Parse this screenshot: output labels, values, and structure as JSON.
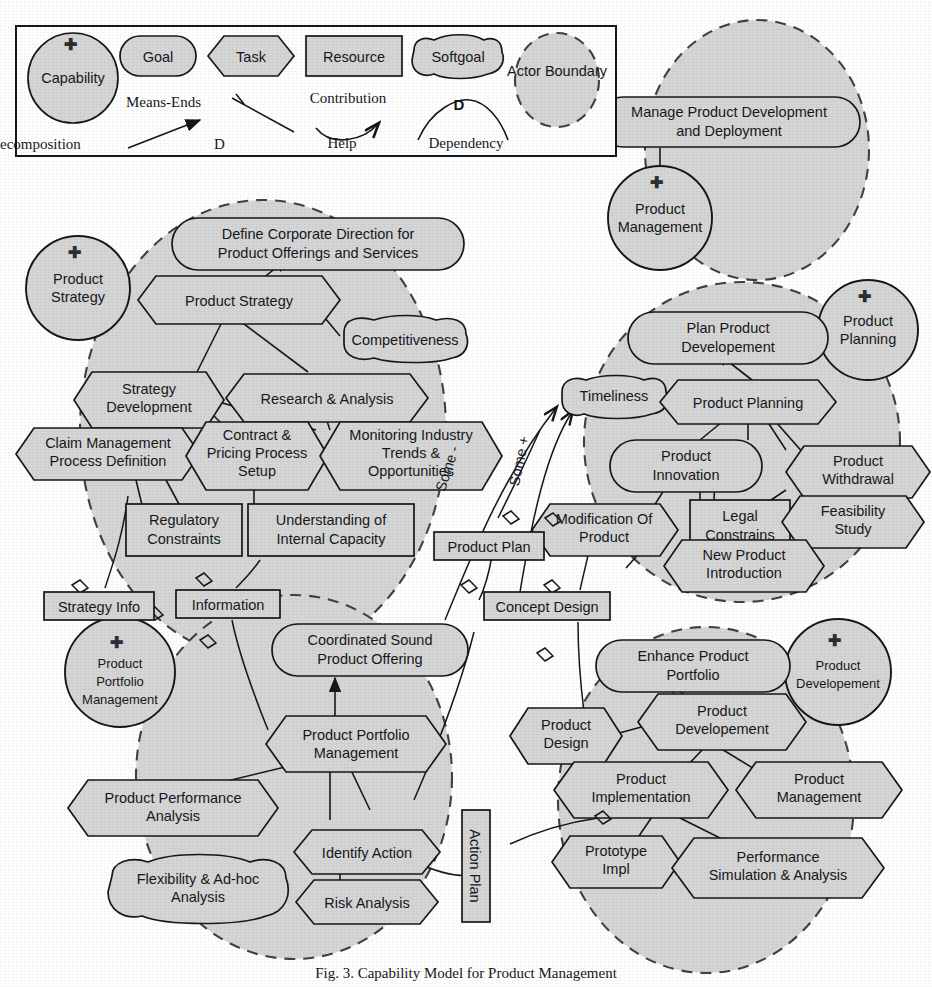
{
  "figure": {
    "title": "Capability Model for Product Management",
    "caption": "Fig. 3. Capability Model for Product Management",
    "colors": {
      "node_fill": "#d6d6d6",
      "node_stroke": "#14181b",
      "boundary_stroke": "#3c4246",
      "page_bg": "#ffffff"
    }
  },
  "legend": {
    "title": "Legend",
    "shapes": [
      {
        "name": "capability",
        "label": "Capability",
        "shape": "circle"
      },
      {
        "name": "goal",
        "label": "Goal",
        "shape": "rounded"
      },
      {
        "name": "task",
        "label": "Task",
        "shape": "hexagon"
      },
      {
        "name": "resource",
        "label": "Resource",
        "shape": "rectangle"
      },
      {
        "name": "softgoal",
        "label": "Softgoal",
        "shape": "cloud"
      },
      {
        "name": "actor-boundary",
        "label": "Actor Boundary",
        "shape": "dashed-circle"
      }
    ],
    "links": [
      {
        "name": "means-ends",
        "label": "Means-Ends"
      },
      {
        "name": "decomposition",
        "label": "Decomposition"
      },
      {
        "name": "contribution",
        "label": "Contribution"
      },
      {
        "name": "help",
        "label": "Help"
      },
      {
        "name": "dependency",
        "label": "Dependency",
        "marker": "D"
      }
    ]
  },
  "actors": [
    {
      "id": "product-management",
      "label": "Product\nManagement",
      "line1": "Product",
      "line2": "Management"
    },
    {
      "id": "product-strategy",
      "label": "Product\nStrategy",
      "line1": "Product",
      "line2": "Strategy"
    },
    {
      "id": "product-planning",
      "label": "Product\nPlanning",
      "line1": "Product",
      "line2": "Planning"
    },
    {
      "id": "product-portfolio-management",
      "label": "Product\nPortfolio\nManagement",
      "line1": "Product",
      "line2": "Portfolio",
      "line3": "Management"
    },
    {
      "id": "product-developement",
      "label": "Product\nDevelopement",
      "line1": "Product",
      "line2": "Developement"
    }
  ],
  "goals": [
    {
      "id": "manage-product-development-and-deployment",
      "line1": "Manage Product Development",
      "line2": "and Deployment"
    },
    {
      "id": "define-corporate-direction",
      "line1": "Define Corporate Direction for",
      "line2": "Product Offerings and Services"
    },
    {
      "id": "plan-product-developement",
      "line1": "Plan Product",
      "line2": "Developement"
    },
    {
      "id": "product-innovation",
      "line1": "Product",
      "line2": "Innovation"
    },
    {
      "id": "coordinated-sound-product-offering",
      "line1": "Coordinated Sound",
      "line2": "Product Offering"
    },
    {
      "id": "enhance-product-portfolio",
      "line1": "Enhance Product",
      "line2": "Portfolio"
    }
  ],
  "softgoals": [
    {
      "id": "competitiveness",
      "line1": "Competitiveness",
      "line2": ""
    },
    {
      "id": "timeliness",
      "line1": "Timeliness",
      "line2": ""
    },
    {
      "id": "flexibility-ad-hoc-analysis",
      "line1": "Flexibility & Ad-hoc",
      "line2": "Analysis"
    }
  ],
  "tasks": [
    {
      "id": "product-strategy-task",
      "line1": "Product Strategy",
      "line2": "",
      "line3": ""
    },
    {
      "id": "strategy-development",
      "line1": "Strategy",
      "line2": "Development",
      "line3": ""
    },
    {
      "id": "research-and-analysis",
      "line1": "Research & Analysis",
      "line2": "",
      "line3": ""
    },
    {
      "id": "claim-management-process-definition",
      "line1": "Claim Management",
      "line2": "Process Definition",
      "line3": ""
    },
    {
      "id": "contract-pricing-process-setup",
      "line1": "Contract &",
      "line2": "Pricing Process",
      "line3": "Setup"
    },
    {
      "id": "monitoring-industry-trends",
      "line1": "Monitoring Industry",
      "line2": "Trends &",
      "line3": "Opportunities"
    },
    {
      "id": "product-planning-task",
      "line1": "Product Planning",
      "line2": "",
      "line3": ""
    },
    {
      "id": "product-withdrawal",
      "line1": "Product",
      "line2": "Withdrawal",
      "line3": ""
    },
    {
      "id": "feasibility-study",
      "line1": "Feasibility",
      "line2": "Study",
      "line3": ""
    },
    {
      "id": "modification-of-product",
      "line1": "Modification Of",
      "line2": "Product",
      "line3": ""
    },
    {
      "id": "new-product-introduction",
      "line1": "New Product",
      "line2": "Introduction",
      "line3": ""
    },
    {
      "id": "product-portfolio-management-task",
      "line1": "Product Portfolio",
      "line2": "Management",
      "line3": ""
    },
    {
      "id": "product-performance-analysis",
      "line1": "Product Performance",
      "line2": "Analysis",
      "line3": ""
    },
    {
      "id": "identify-action",
      "line1": "Identify Action",
      "line2": "",
      "line3": ""
    },
    {
      "id": "risk-analysis",
      "line1": "Risk Analysis",
      "line2": "",
      "line3": ""
    },
    {
      "id": "product-design",
      "line1": "Product",
      "line2": "Design",
      "line3": ""
    },
    {
      "id": "product-developement-task",
      "line1": "Product",
      "line2": "Developement",
      "line3": ""
    },
    {
      "id": "product-implementation",
      "line1": "Product",
      "line2": "Implementation",
      "line3": ""
    },
    {
      "id": "product-management-task",
      "line1": "Product",
      "line2": "Management",
      "line3": ""
    },
    {
      "id": "prototype-impl",
      "line1": "Prototype",
      "line2": "Impl",
      "line3": ""
    },
    {
      "id": "performance-simulation-analysis",
      "line1": "Performance",
      "line2": "Simulation & Analysis",
      "line3": ""
    }
  ],
  "resources": [
    {
      "id": "regulatory-constraints",
      "line1": "Regulatory",
      "line2": "Constraints"
    },
    {
      "id": "understanding-internal-capacity",
      "line1": "Understanding of",
      "line2": "Internal Capacity"
    },
    {
      "id": "legal-constrains",
      "line1": "Legal",
      "line2": "Constrains"
    },
    {
      "id": "strategy-info",
      "line1": "Strategy Info",
      "line2": ""
    },
    {
      "id": "information",
      "line1": "Information",
      "line2": ""
    },
    {
      "id": "product-plan",
      "line1": "Product Plan",
      "line2": ""
    },
    {
      "id": "concept-design",
      "line1": "Concept Design",
      "line2": ""
    },
    {
      "id": "action-plan",
      "line1": "Action Plan",
      "line2": ""
    }
  ],
  "contribution_labels": [
    {
      "id": "some-minus",
      "label": "Some -"
    },
    {
      "id": "some-plus",
      "label": "Some +"
    }
  ]
}
